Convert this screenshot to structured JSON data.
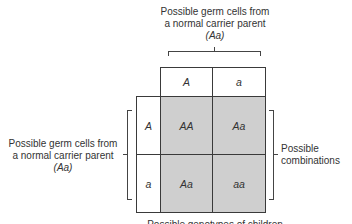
{
  "top_parent": {
    "line1": "Possible germ cells from",
    "line2": "a normal carrier parent",
    "genotype": "(Aa)"
  },
  "left_parent": {
    "line1": "Possible germ cells from",
    "line2": "a normal carrier parent",
    "genotype": "(Aa)"
  },
  "right_label": {
    "line1": "Possible",
    "line2": "combinations"
  },
  "bottom_label": "Possible genotypes of children",
  "grid": {
    "col_headers": [
      "A",
      "a"
    ],
    "row_headers": [
      "A",
      "a"
    ],
    "cells": [
      [
        "AA",
        "Aa"
      ],
      [
        "Aa",
        "aa"
      ]
    ]
  },
  "colors": {
    "shade": "#cfcfcf",
    "line": "#3a3a3a"
  }
}
